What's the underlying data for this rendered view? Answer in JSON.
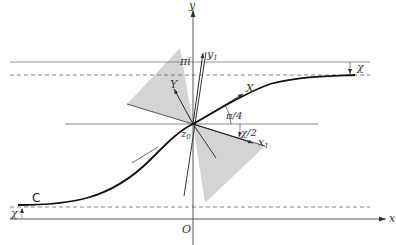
{
  "figure": {
    "labels": {
      "y_axis": "y",
      "x_axis": "x",
      "origin": "O",
      "pi_i": "πi",
      "curve": "C",
      "chi_top": "χ",
      "chi_bottom": "χ",
      "Y": "Y",
      "X": "X",
      "y1": "y",
      "y1_sub": "1",
      "x1": "x",
      "x1_sub": "1",
      "z0": "z",
      "z0_sub": "0",
      "angle_pi_4": "π/4",
      "angle_chi_2": "χ/2"
    },
    "colors": {
      "axis": "#555555",
      "curve": "#111111",
      "guide": "#888888",
      "shade": "#cfcfcf",
      "vector": "#222222"
    }
  }
}
